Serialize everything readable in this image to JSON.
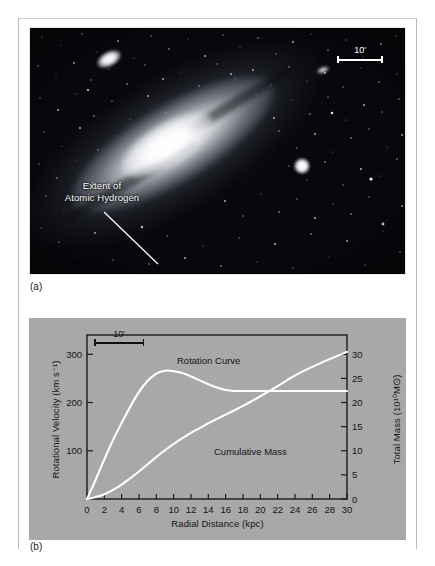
{
  "figure": {
    "panel_a_label": "(a)",
    "panel_b_label": "(b)"
  },
  "photo": {
    "annotation": "Extent of\nAtomic Hydrogen",
    "annotation_line1": "Extent of",
    "annotation_line2": "Atomic Hydrogen",
    "scale_bar_label": "10'"
  },
  "chart_data": {
    "type": "line",
    "title": "",
    "xlabel": "Radial Distance (kpc)",
    "ylabel": "Rotational Velocity (km s⁻¹)",
    "ylabel_right": "Total Mass (10¹⁰M⊙)",
    "xlim": [
      0,
      30
    ],
    "ylim": [
      0,
      340
    ],
    "ylim_right": [
      0,
      34
    ],
    "grid": false,
    "legend": "inline-labels",
    "xticks": [
      0,
      2,
      4,
      6,
      8,
      10,
      12,
      14,
      16,
      18,
      20,
      22,
      24,
      26,
      28,
      30
    ],
    "xticklabels": [
      "0",
      "2",
      "4",
      "6",
      "8",
      "10",
      "12",
      "14",
      "16",
      "18",
      "20",
      "22",
      "24",
      "26",
      "28",
      "30"
    ],
    "yticks_left": [
      100,
      200,
      300
    ],
    "yticklabels_left": [
      "100",
      "200",
      "300"
    ],
    "yticks_right": [
      0,
      5,
      10,
      15,
      20,
      25,
      30
    ],
    "yticklabels_right": [
      "0",
      "5",
      "10",
      "15",
      "20",
      "25",
      "30"
    ],
    "inplot_scale_label": "10'",
    "series": [
      {
        "name": "Rotation Curve",
        "axis": "left",
        "units": "km s^-1",
        "x": [
          0,
          1,
          2,
          3,
          4,
          5,
          6,
          7,
          8,
          9,
          10,
          11,
          12,
          13,
          14,
          15,
          16,
          17,
          18,
          20,
          22,
          24,
          26,
          28,
          30
        ],
        "values": [
          0,
          40,
          82,
          122,
          158,
          192,
          222,
          245,
          260,
          266,
          265,
          261,
          254,
          246,
          238,
          231,
          226,
          224,
          224,
          224,
          224,
          224,
          224,
          224,
          224
        ]
      },
      {
        "name": "Cumulative Mass",
        "axis": "right",
        "units": "10^10 Msun",
        "x": [
          0,
          1,
          2,
          3,
          4,
          5,
          6,
          7,
          8,
          9,
          10,
          11,
          12,
          13,
          14,
          15,
          16,
          17,
          18,
          20,
          22,
          24,
          26,
          28,
          30
        ],
        "values": [
          0.0,
          0.4,
          1.0,
          1.9,
          3.0,
          4.3,
          5.7,
          7.2,
          8.7,
          10.1,
          11.4,
          12.6,
          13.7,
          14.7,
          15.7,
          16.6,
          17.5,
          18.4,
          19.3,
          21.3,
          23.4,
          25.6,
          27.4,
          29.0,
          30.5
        ]
      }
    ]
  }
}
